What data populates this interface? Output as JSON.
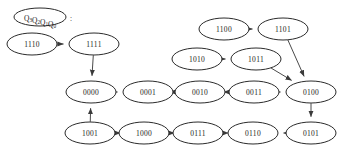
{
  "diagram": {
    "title_legend": {
      "text": "Q3Q2Q1Q0",
      "base": "Q",
      "subscripts": [
        "3",
        "2",
        "1",
        "0"
      ],
      "colon": ":"
    },
    "nodes": [
      {
        "id": "1110",
        "label": "1110",
        "cx": 32,
        "cy": 44
      },
      {
        "id": "1111",
        "label": "1111",
        "cx": 94,
        "cy": 44
      },
      {
        "id": "1100",
        "label": "1100",
        "cx": 224,
        "cy": 29
      },
      {
        "id": "1101",
        "label": "1101",
        "cx": 283,
        "cy": 29
      },
      {
        "id": "1010",
        "label": "1010",
        "cx": 197,
        "cy": 59
      },
      {
        "id": "1011",
        "label": "1011",
        "cx": 256,
        "cy": 59
      },
      {
        "id": "0000",
        "label": "0000",
        "cx": 91,
        "cy": 92
      },
      {
        "id": "0001",
        "label": "0001",
        "cx": 148,
        "cy": 92
      },
      {
        "id": "0010",
        "label": "0010",
        "cx": 200,
        "cy": 92
      },
      {
        "id": "0011",
        "label": "0011",
        "cx": 254,
        "cy": 92
      },
      {
        "id": "0100",
        "label": "0100",
        "cx": 311,
        "cy": 92
      },
      {
        "id": "0101",
        "label": "0101",
        "cx": 311,
        "cy": 133
      },
      {
        "id": "0110",
        "label": "0110",
        "cx": 253,
        "cy": 133
      },
      {
        "id": "0111",
        "label": "0111",
        "cx": 198,
        "cy": 133
      },
      {
        "id": "1000",
        "label": "1000",
        "cx": 144,
        "cy": 133
      },
      {
        "id": "1001",
        "label": "1001",
        "cx": 90,
        "cy": 133
      }
    ],
    "node_rx": 25,
    "node_ry": 11,
    "legend": {
      "cx": 40,
      "cy": 17,
      "rx": 26,
      "ry": 9
    },
    "edges": [
      {
        "from": "1110",
        "to": "1111",
        "kind": "horizontal"
      },
      {
        "from": "1111",
        "to": "0000",
        "kind": "vertical"
      },
      {
        "from": "0000",
        "to": "0001",
        "kind": "horizontal"
      },
      {
        "from": "0001",
        "to": "0010",
        "kind": "horizontal"
      },
      {
        "from": "0010",
        "to": "0011",
        "kind": "horizontal"
      },
      {
        "from": "0011",
        "to": "0100",
        "kind": "horizontal"
      },
      {
        "from": "0100",
        "to": "0101",
        "kind": "vertical"
      },
      {
        "from": "0101",
        "to": "0110",
        "kind": "horizontal"
      },
      {
        "from": "0110",
        "to": "0111",
        "kind": "horizontal"
      },
      {
        "from": "0111",
        "to": "1000",
        "kind": "horizontal"
      },
      {
        "from": "1000",
        "to": "1001",
        "kind": "horizontal"
      },
      {
        "from": "1001",
        "to": "0000",
        "kind": "vertical"
      },
      {
        "from": "1100",
        "to": "1101",
        "kind": "horizontal"
      },
      {
        "from": "1101",
        "to": "0100",
        "kind": "diagonal"
      },
      {
        "from": "1010",
        "to": "1011",
        "kind": "horizontal"
      },
      {
        "from": "1011",
        "to": "0100",
        "kind": "diagonal"
      }
    ]
  }
}
